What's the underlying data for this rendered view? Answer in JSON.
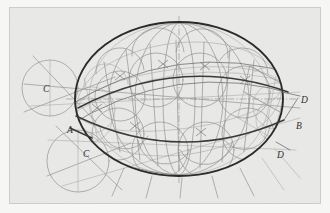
{
  "document": {
    "title": "Descriptive geometry construction: sphere with inscribed toroidal band",
    "medium": "pencil drawing on paper",
    "background_color": "#e9e9e7",
    "ink_color": "#2b2b2b",
    "construction_color": "#8d8d8d"
  },
  "frame": {
    "name": "sheet-border",
    "x": 9,
    "y": 7,
    "width": 312,
    "height": 198,
    "stroke": "#c9c9c6"
  },
  "labels": [
    {
      "id": "label-c-upper-left",
      "text": "C",
      "x": 43,
      "y": 92
    },
    {
      "id": "label-a",
      "text": "A",
      "x": 67,
      "y": 133
    },
    {
      "id": "label-c-lower-left",
      "text": "C",
      "x": 83,
      "y": 157
    },
    {
      "id": "label-d-upper-right",
      "text": "D",
      "x": 301,
      "y": 103
    },
    {
      "id": "label-b",
      "text": "B",
      "x": 296,
      "y": 129
    },
    {
      "id": "label-d-lower-right",
      "text": "D",
      "x": 277,
      "y": 158
    }
  ],
  "main_ellipse": {
    "name": "primary-sphere-outline",
    "cx": 179,
    "cy": 99,
    "rx": 104,
    "ry": 77,
    "stroke_width": 1.9
  },
  "equator_band": {
    "name": "equator-band",
    "upper_arc_label": "upper band edge",
    "lower_arc_label": "lower band edge",
    "heavy_arc_label": "heavy equator arc"
  },
  "construction_circles": [
    {
      "id": "circle-c-upper",
      "cx": 50,
      "cy": 88,
      "r": 28
    },
    {
      "id": "circle-c-lower",
      "cx": 78,
      "cy": 161,
      "r": 31
    }
  ],
  "center_axes": {
    "vertical": {
      "x": 179,
      "y1": 18,
      "y2": 181
    },
    "horizontal": {
      "y": 99,
      "x1": 70,
      "x2": 292
    }
  },
  "meridian_count": 6,
  "latitude_count": 3,
  "annotations": {
    "point_a": "A",
    "point_b": "B",
    "points_c": "C",
    "points_d": "D"
  }
}
